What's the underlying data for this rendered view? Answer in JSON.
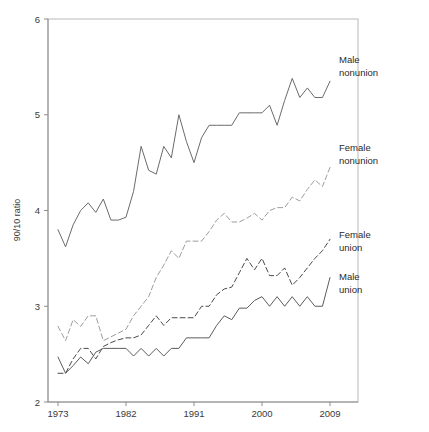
{
  "figure": {
    "background": "#ffffff",
    "plot_border_color": "#b9b9b9",
    "axis_color": "#8c8c8c",
    "text_color": "#3a3a3a"
  },
  "axis": {
    "y_title": "90/10 ratio",
    "y_ticks": [
      "2",
      "3",
      "4",
      "5",
      "6"
    ],
    "x_ticks": [
      "1973",
      "1982",
      "1991",
      "2000",
      "2009"
    ]
  },
  "labels": {
    "male_nonunion_line1": "Male",
    "male_nonunion_line2": "nonunion",
    "female_nonunion_line1": "Female",
    "female_nonunion_line2": "nonunion",
    "female_union_line1": "Female",
    "female_union_line2": "union",
    "male_union_line1": "Male",
    "male_union_line2": "union"
  },
  "chart_data": {
    "type": "line",
    "title": "",
    "xlabel": "",
    "ylabel": "90/10 ratio",
    "xlim": [
      1973,
      2010
    ],
    "ylim": [
      2,
      6
    ],
    "xticks": [
      1973,
      1982,
      1991,
      2000,
      2009
    ],
    "yticks": [
      2,
      3,
      4,
      5,
      6
    ],
    "grid": false,
    "legend_position": "right-inline-annotations",
    "x": [
      1973,
      1974,
      1975,
      1976,
      1977,
      1978,
      1979,
      1980,
      1981,
      1982,
      1983,
      1984,
      1985,
      1986,
      1987,
      1988,
      1989,
      1990,
      1991,
      1992,
      1993,
      1994,
      1995,
      1996,
      1997,
      1998,
      1999,
      2000,
      2001,
      2002,
      2003,
      2004,
      2005,
      2006,
      2007,
      2008,
      2009
    ],
    "series": [
      {
        "name": "Male nonunion",
        "color": "#6b6b6b",
        "style": "solid",
        "label_lines": [
          "Male",
          "nonunion"
        ],
        "values": [
          3.8,
          3.62,
          3.85,
          4.0,
          4.08,
          3.98,
          4.12,
          3.9,
          3.9,
          3.93,
          4.2,
          4.67,
          4.42,
          4.38,
          4.67,
          4.55,
          5.0,
          4.72,
          4.5,
          4.76,
          4.89,
          4.89,
          4.89,
          4.89,
          5.02,
          5.02,
          5.02,
          5.02,
          5.1,
          4.89,
          5.15,
          5.38,
          5.18,
          5.28,
          5.18,
          5.18,
          5.35
        ]
      },
      {
        "name": "Female nonunion",
        "color": "#9d9d9d",
        "style": "dashed",
        "label_lines": [
          "Female",
          "nonunion"
        ],
        "values": [
          2.79,
          2.64,
          2.86,
          2.79,
          2.9,
          2.9,
          2.64,
          2.68,
          2.72,
          2.76,
          2.9,
          3.0,
          3.1,
          3.3,
          3.43,
          3.58,
          3.5,
          3.68,
          3.68,
          3.68,
          3.78,
          3.9,
          3.97,
          3.88,
          3.88,
          3.92,
          3.97,
          3.9,
          4.0,
          4.03,
          4.03,
          4.14,
          4.1,
          4.22,
          4.32,
          4.25,
          4.45
        ]
      },
      {
        "name": "Female union",
        "color": "#4a4a4a",
        "style": "dashed",
        "label_lines": [
          "Female",
          "union"
        ],
        "values": [
          2.3,
          2.3,
          2.45,
          2.56,
          2.56,
          2.45,
          2.58,
          2.62,
          2.65,
          2.67,
          2.67,
          2.7,
          2.8,
          2.9,
          2.8,
          2.88,
          2.88,
          2.88,
          2.88,
          3.0,
          3.0,
          3.12,
          3.18,
          3.2,
          3.35,
          3.5,
          3.38,
          3.5,
          3.32,
          3.32,
          3.4,
          3.22,
          3.3,
          3.4,
          3.5,
          3.58,
          3.7
        ]
      },
      {
        "name": "Male union",
        "color": "#5c5c5c",
        "style": "solid",
        "label_lines": [
          "Male",
          "union"
        ],
        "values": [
          2.47,
          2.3,
          2.38,
          2.47,
          2.4,
          2.52,
          2.56,
          2.56,
          2.56,
          2.56,
          2.48,
          2.56,
          2.48,
          2.56,
          2.48,
          2.56,
          2.56,
          2.67,
          2.67,
          2.67,
          2.67,
          2.8,
          2.9,
          2.86,
          2.98,
          2.98,
          3.06,
          3.1,
          3.0,
          3.1,
          3.0,
          3.1,
          3.0,
          3.1,
          3.0,
          3.0,
          3.3
        ]
      }
    ]
  }
}
